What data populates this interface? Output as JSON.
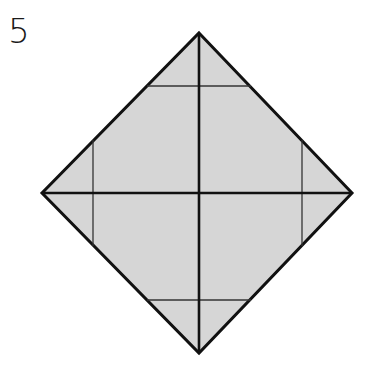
{
  "step": {
    "number": "5"
  },
  "diagram": {
    "type": "origami-fold-diagram",
    "shape": "square-diamond",
    "fill_color": "#d6d6d6",
    "stroke_color": "#111111",
    "vertices": {
      "top": [
        199,
        33
      ],
      "right": [
        352,
        193
      ],
      "bottom": [
        199,
        353
      ],
      "left": [
        42,
        193
      ]
    },
    "crease_lines": {
      "diagonals": [
        [
          [
            199,
            33
          ],
          [
            199,
            353
          ]
        ],
        [
          [
            42,
            193
          ],
          [
            352,
            193
          ]
        ]
      ],
      "fold_guides": [
        [
          [
            147,
            86
          ],
          [
            251,
            86
          ]
        ],
        [
          [
            147,
            300
          ],
          [
            251,
            300
          ]
        ],
        [
          [
            93,
            140
          ],
          [
            93,
            246
          ]
        ],
        [
          [
            302,
            140
          ],
          [
            302,
            246
          ]
        ]
      ]
    }
  }
}
